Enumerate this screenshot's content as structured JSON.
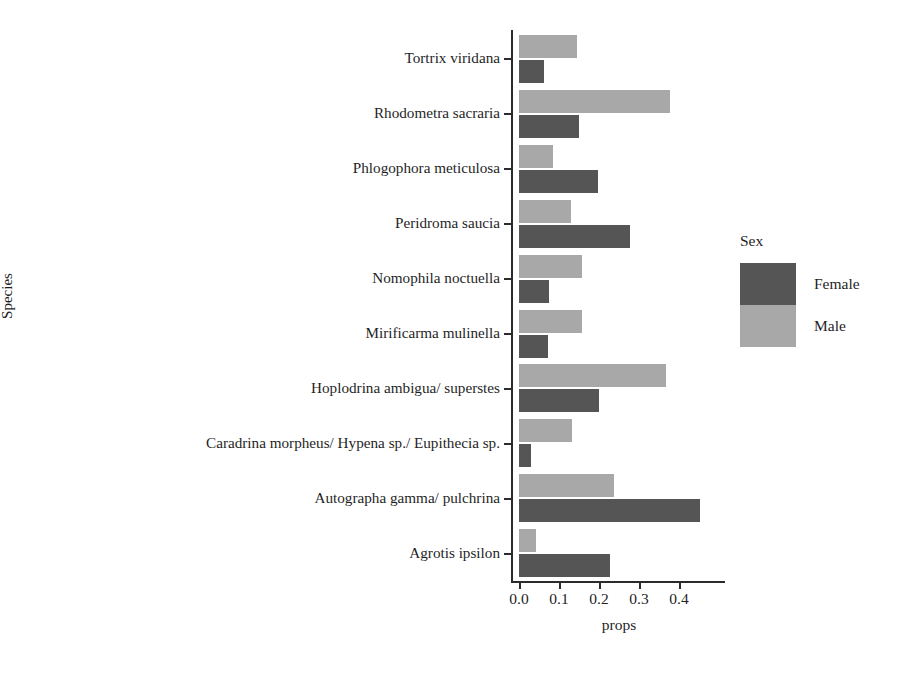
{
  "chart_data": {
    "type": "bar",
    "orientation": "horizontal",
    "grouped": true,
    "title": "",
    "xlabel": "props",
    "ylabel": "Species",
    "xlim": [
      0.0,
      0.5
    ],
    "xticks": [
      0.0,
      0.1,
      0.2,
      0.3,
      0.4
    ],
    "xtick_labels": [
      "0.0",
      "0.1",
      "0.2",
      "0.3",
      "0.4"
    ],
    "grid": false,
    "legend": {
      "title": "Sex",
      "position": "right",
      "entries": [
        {
          "label": "Female",
          "color": "#555555"
        },
        {
          "label": "Male",
          "color": "#a8a8a8"
        }
      ]
    },
    "categories": [
      "Tortrix viridana",
      "Rhodometra sacraria",
      "Phlogophora meticulosa",
      "Peridroma saucia",
      "Nomophila noctuella",
      "Mirificarma mulinella",
      "Hoplodrina ambigua/ superstes",
      "Caradrina morpheus/ Hypena sp./ Eupithecia sp.",
      "Autographa gamma/ pulchrina",
      "Agrotis ipsilon"
    ],
    "series": [
      {
        "name": "Male",
        "color": "#a8a8a8",
        "values": [
          0.145,
          0.378,
          0.085,
          0.13,
          0.157,
          0.157,
          0.368,
          0.133,
          0.238,
          0.042
        ]
      },
      {
        "name": "Female",
        "color": "#555555",
        "values": [
          0.063,
          0.15,
          0.198,
          0.278,
          0.075,
          0.073,
          0.2,
          0.03,
          0.452,
          0.228
        ]
      }
    ]
  },
  "axes": {
    "y_title": "Species",
    "x_title": "props"
  }
}
